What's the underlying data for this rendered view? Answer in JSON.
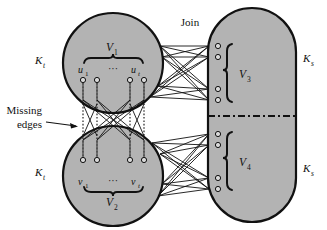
{
  "figure": {
    "title_label": "Join",
    "annotation": {
      "line1": "Missing",
      "line2": "edges"
    },
    "left_top_group": {
      "set_label": "V",
      "set_sub": "1",
      "vertex_first": "u",
      "vertex_first_sub": "1",
      "vertex_last": "u",
      "vertex_last_sub": "t",
      "ellipsis": "···",
      "clique_label": "K",
      "clique_sub": "t"
    },
    "left_bottom_group": {
      "set_label": "V",
      "set_sub": "2",
      "vertex_first": "v",
      "vertex_first_sub": "1",
      "vertex_last": "v",
      "vertex_last_sub": "t",
      "ellipsis": "···",
      "clique_label": "K",
      "clique_sub": "t"
    },
    "right_top_group": {
      "set_label": "V",
      "set_sub": "3",
      "clique_label": "K",
      "clique_sub": "s"
    },
    "right_bottom_group": {
      "set_label": "V",
      "set_sub": "4",
      "clique_label": "K",
      "clique_sub": "s"
    },
    "colors": {
      "fill": "#b3b3b3",
      "stroke": "#111111",
      "vertex_fill": "#d9d9d9",
      "background": "#ffffff"
    }
  }
}
